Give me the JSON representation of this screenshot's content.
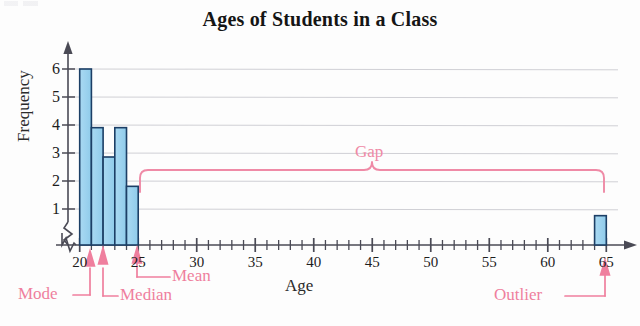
{
  "chart_data": {
    "type": "bar",
    "title": "Ages of Students in a Class",
    "xlabel": "Age",
    "ylabel": "Frequency",
    "xlim": [
      19,
      66
    ],
    "ylim": [
      0,
      6.4
    ],
    "grid": true,
    "legend": "none",
    "bin_width": 1,
    "categories": [
      "20-21",
      "21-22",
      "22-23",
      "23-24",
      "24-25",
      "64-65"
    ],
    "bin_starts": [
      20,
      21,
      22,
      23,
      24,
      64
    ],
    "values": [
      6,
      4,
      3,
      4,
      2,
      1
    ],
    "x_tick_labels": [
      "20",
      "25",
      "30",
      "35",
      "40",
      "45",
      "50",
      "55",
      "60",
      "65"
    ],
    "x_tick_values": [
      20,
      25,
      30,
      35,
      40,
      45,
      50,
      55,
      60,
      65
    ],
    "x_minor_step": 1,
    "y_tick_labels": [
      "1",
      "2",
      "3",
      "4",
      "5",
      "6"
    ],
    "y_tick_values": [
      1,
      2,
      3,
      4,
      5,
      6
    ],
    "axis_break_x": true,
    "axis_break_y": true,
    "bar_fill": "#9fd4ef",
    "bar_stroke": "#1c3f66",
    "grid_color": "#c9c9cf",
    "annotation_color": "#ef7f9e",
    "annotations": [
      {
        "name": "mode",
        "label": "Mode",
        "points_to_x": 20.5
      },
      {
        "name": "median",
        "label": "Median",
        "points_to_x": 21.5
      },
      {
        "name": "mean",
        "label": "Mean",
        "points_to_x": 24.0
      },
      {
        "name": "gap",
        "label": "Gap",
        "span_x": [
          25,
          64
        ]
      },
      {
        "name": "outlier",
        "label": "Outlier",
        "points_to_x": 64.5
      }
    ]
  },
  "chart": {
    "title": "Ages of Students in a Class",
    "xlabel": "Age",
    "ylabel": "Frequency"
  },
  "labels": {
    "mode": "Mode",
    "median": "Median",
    "mean": "Mean",
    "gap": "Gap",
    "outlier": "Outlier"
  }
}
